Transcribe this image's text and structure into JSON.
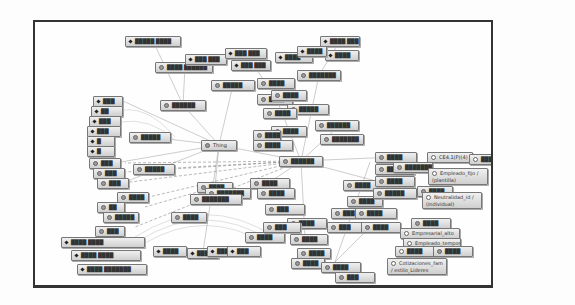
{
  "diagram": {
    "type": "ontology-graph",
    "frame": {
      "border_color": "#333333",
      "background": "#fefefe"
    },
    "colors": {
      "node_fill_top": "#f0f0f0",
      "node_fill_bottom": "#cfcfcf",
      "node_border": "#777777",
      "edge": "#999999"
    },
    "center_nodes": [
      {
        "id": "thing",
        "label": "Thing"
      }
    ],
    "nodes": [
      {
        "id": "n1",
        "label": "█████ ████",
        "kind": "ind",
        "x": 90,
        "y": 14,
        "w": 56
      },
      {
        "id": "n2",
        "label": "████ ██████",
        "kind": "cls",
        "x": 120,
        "y": 40,
        "w": 58
      },
      {
        "id": "n3",
        "label": "███ ███",
        "kind": "ind",
        "x": 150,
        "y": 32,
        "w": 42
      },
      {
        "id": "n4",
        "label": "███ ███",
        "kind": "ind",
        "x": 190,
        "y": 26,
        "w": 42
      },
      {
        "id": "n5",
        "label": "███ ███",
        "kind": "ind",
        "x": 196,
        "y": 38,
        "w": 40
      },
      {
        "id": "n6",
        "label": "████",
        "kind": "ind",
        "x": 240,
        "y": 30,
        "w": 38
      },
      {
        "id": "n7",
        "label": "████ ███",
        "kind": "ind",
        "x": 285,
        "y": 14,
        "w": 40
      },
      {
        "id": "n8",
        "label": "████",
        "kind": "ind",
        "x": 290,
        "y": 28,
        "w": 34
      },
      {
        "id": "n9",
        "label": "████",
        "kind": "ind",
        "x": 262,
        "y": 24,
        "w": 30
      },
      {
        "id": "n10",
        "label": "███████",
        "kind": "cls",
        "x": 262,
        "y": 48,
        "w": 44
      },
      {
        "id": "n11",
        "label": "█████",
        "kind": "cls",
        "x": 176,
        "y": 58,
        "w": 44
      },
      {
        "id": "n12",
        "label": "██████",
        "kind": "cls",
        "x": 125,
        "y": 78,
        "w": 46
      },
      {
        "id": "n13",
        "label": "████",
        "kind": "cls",
        "x": 222,
        "y": 56,
        "w": 38
      },
      {
        "id": "n14",
        "label": "████",
        "kind": "cls",
        "x": 222,
        "y": 72,
        "w": 36
      },
      {
        "id": "n15",
        "label": "████",
        "kind": "cls",
        "x": 236,
        "y": 68,
        "w": 36
      },
      {
        "id": "n16",
        "label": "█████",
        "kind": "cls",
        "x": 252,
        "y": 82,
        "w": 42
      },
      {
        "id": "n17",
        "label": "████",
        "kind": "cls",
        "x": 228,
        "y": 86,
        "w": 34
      },
      {
        "id": "n18",
        "label": "██████",
        "kind": "cls",
        "x": 280,
        "y": 98,
        "w": 44
      },
      {
        "id": "n19",
        "label": "████",
        "kind": "cls",
        "x": 236,
        "y": 104,
        "w": 36
      },
      {
        "id": "n20",
        "label": "████",
        "kind": "cls",
        "x": 218,
        "y": 108,
        "w": 28
      },
      {
        "id": "n21",
        "label": "████",
        "kind": "cls",
        "x": 218,
        "y": 118,
        "w": 40
      },
      {
        "id": "n22",
        "label": "███████",
        "kind": "cls",
        "x": 285,
        "y": 112,
        "w": 44
      },
      {
        "id": "n23",
        "label": "█████",
        "kind": "cls",
        "x": 94,
        "y": 110,
        "w": 42
      },
      {
        "id": "n24",
        "label": "███",
        "kind": "ind",
        "x": 58,
        "y": 74,
        "w": 30
      },
      {
        "id": "n25",
        "label": "██",
        "kind": "ind",
        "x": 56,
        "y": 84,
        "w": 32
      },
      {
        "id": "n26",
        "label": "███",
        "kind": "ind",
        "x": 54,
        "y": 94,
        "w": 32
      },
      {
        "id": "n27",
        "label": "███",
        "kind": "ind",
        "x": 52,
        "y": 104,
        "w": 34
      },
      {
        "id": "n28",
        "label": "█",
        "kind": "ind",
        "x": 52,
        "y": 114,
        "w": 28
      },
      {
        "id": "n29",
        "label": "█",
        "kind": "ind",
        "x": 52,
        "y": 124,
        "w": 28
      },
      {
        "id": "n30",
        "label": "███",
        "kind": "cls",
        "x": 54,
        "y": 136,
        "w": 32
      },
      {
        "id": "n31",
        "label": "███",
        "kind": "cls",
        "x": 58,
        "y": 146,
        "w": 32
      },
      {
        "id": "n32",
        "label": "███",
        "kind": "cls",
        "x": 62,
        "y": 156,
        "w": 32
      },
      {
        "id": "n33",
        "label": "█████",
        "kind": "cls",
        "x": 98,
        "y": 142,
        "w": 42
      },
      {
        "id": "n34",
        "label": "████",
        "kind": "cls",
        "x": 82,
        "y": 170,
        "w": 32
      },
      {
        "id": "n35",
        "label": "██",
        "kind": "cls",
        "x": 62,
        "y": 180,
        "w": 28
      },
      {
        "id": "n36",
        "label": "█████",
        "kind": "cls",
        "x": 68,
        "y": 190,
        "w": 36
      },
      {
        "id": "n37",
        "label": "███",
        "kind": "cls",
        "x": 60,
        "y": 204,
        "w": 30
      },
      {
        "id": "n38",
        "label": "████ ████",
        "kind": "ind",
        "x": 26,
        "y": 215,
        "w": 84
      },
      {
        "id": "n39",
        "label": "████ ████",
        "kind": "ind",
        "x": 36,
        "y": 228,
        "w": 70
      },
      {
        "id": "n40",
        "label": "████ ███████",
        "kind": "ind",
        "x": 42,
        "y": 242,
        "w": 70
      },
      {
        "id": "n41",
        "label": "████",
        "kind": "cls",
        "x": 136,
        "y": 190,
        "w": 36
      },
      {
        "id": "n42",
        "label": "███████",
        "kind": "cls",
        "x": 170,
        "y": 166,
        "w": 46
      },
      {
        "id": "n43",
        "label": "███████",
        "kind": "cls",
        "x": 155,
        "y": 172,
        "w": 52
      },
      {
        "id": "n44",
        "label": "████",
        "kind": "ind",
        "x": 118,
        "y": 224,
        "w": 34
      },
      {
        "id": "n45",
        "label": "████",
        "kind": "ind",
        "x": 152,
        "y": 226,
        "w": 32
      },
      {
        "id": "n46",
        "label": "███",
        "kind": "ind",
        "x": 172,
        "y": 224,
        "w": 30
      },
      {
        "id": "n47",
        "label": "███",
        "kind": "ind",
        "x": 192,
        "y": 224,
        "w": 34
      },
      {
        "id": "n48",
        "label": "████",
        "kind": "cls",
        "x": 210,
        "y": 210,
        "w": 40
      },
      {
        "id": "n49",
        "label": "████",
        "kind": "cls",
        "x": 222,
        "y": 166,
        "w": 38
      },
      {
        "id": "n50",
        "label": "███",
        "kind": "cls",
        "x": 230,
        "y": 182,
        "w": 40
      },
      {
        "id": "n51",
        "label": "████",
        "kind": "cls",
        "x": 252,
        "y": 196,
        "w": 40
      },
      {
        "id": "n52",
        "label": "███",
        "kind": "cls",
        "x": 228,
        "y": 200,
        "w": 38
      },
      {
        "id": "n53",
        "label": "████",
        "kind": "cls",
        "x": 255,
        "y": 212,
        "w": 38
      },
      {
        "id": "n54",
        "label": "████",
        "kind": "cls",
        "x": 262,
        "y": 226,
        "w": 34
      },
      {
        "id": "n55",
        "label": "████",
        "kind": "cls",
        "x": 256,
        "y": 236,
        "w": 34
      },
      {
        "id": "n56",
        "label": "████",
        "kind": "cls",
        "x": 308,
        "y": 158,
        "w": 36
      },
      {
        "id": "n57",
        "label": "████",
        "kind": "cls",
        "x": 312,
        "y": 174,
        "w": 36
      },
      {
        "id": "n58",
        "label": "███",
        "kind": "cls",
        "x": 296,
        "y": 186,
        "w": 40
      },
      {
        "id": "n59",
        "label": "███",
        "kind": "cls",
        "x": 292,
        "y": 200,
        "w": 36
      },
      {
        "id": "n60",
        "label": "████",
        "kind": "cls",
        "x": 340,
        "y": 130,
        "w": 42
      },
      {
        "id": "n61",
        "label": "████",
        "kind": "cls",
        "x": 340,
        "y": 142,
        "w": 40
      },
      {
        "id": "n62",
        "label": "████",
        "kind": "cls",
        "x": 340,
        "y": 154,
        "w": 40
      },
      {
        "id": "n63",
        "label": "█████",
        "kind": "cls",
        "x": 338,
        "y": 166,
        "w": 44
      },
      {
        "id": "n64",
        "label": "████",
        "kind": "cls",
        "x": 320,
        "y": 186,
        "w": 42
      },
      {
        "id": "n65",
        "label": "████",
        "kind": "cls",
        "x": 326,
        "y": 200,
        "w": 40
      },
      {
        "id": "n66",
        "label": "████",
        "kind": "cls",
        "x": 286,
        "y": 240,
        "w": 40
      },
      {
        "id": "n67",
        "label": "███",
        "kind": "cls",
        "x": 300,
        "y": 250,
        "w": 40
      },
      {
        "id": "n68",
        "label": "CE4.1(P)(4)",
        "kind": "hollow",
        "x": 392,
        "y": 130,
        "w": 46
      },
      {
        "id": "n69",
        "label": "████",
        "kind": "hollow",
        "x": 434,
        "y": 132,
        "w": 26
      },
      {
        "id": "n70",
        "label": "████████",
        "kind": "cls",
        "x": 358,
        "y": 140,
        "w": 40
      },
      {
        "id": "n71",
        "label": "Empleado_fijo / (plantilla)",
        "kind": "hollow",
        "x": 393,
        "y": 146,
        "w": 60,
        "tall": true
      },
      {
        "id": "n72",
        "label": "████",
        "kind": "cls",
        "x": 382,
        "y": 164,
        "w": 36
      },
      {
        "id": "n73",
        "label": "Neutralidad_id / (individual)",
        "kind": "hollow",
        "x": 387,
        "y": 170,
        "w": 60,
        "tall": true
      },
      {
        "id": "n74",
        "label": "████",
        "kind": "cls",
        "x": 376,
        "y": 196,
        "w": 40
      },
      {
        "id": "n75",
        "label": "Empresarial_alto",
        "kind": "hollow",
        "x": 365,
        "y": 206,
        "w": 60
      },
      {
        "id": "n76",
        "label": "Empleado_temporal",
        "kind": "hollow",
        "x": 368,
        "y": 216,
        "w": 58
      },
      {
        "id": "n77",
        "label": "████",
        "kind": "hollow",
        "x": 360,
        "y": 224,
        "w": 44
      },
      {
        "id": "n78",
        "label": "████",
        "kind": "cls",
        "x": 398,
        "y": 224,
        "w": 40
      },
      {
        "id": "n79",
        "label": "Cotizaciones_fam / estilo_Lideres",
        "kind": "hollow",
        "x": 352,
        "y": 236,
        "w": 60,
        "tall": true
      }
    ],
    "special_nodes": {
      "thing": {
        "label": "Thing",
        "x": 166,
        "y": 118,
        "w": 36
      },
      "hub": {
        "label": "██████",
        "x": 244,
        "y": 134,
        "w": 44
      },
      "hub2": {
        "label": "████",
        "x": 215,
        "y": 156,
        "w": 40
      },
      "mid1": {
        "label": "████",
        "x": 162,
        "y": 160,
        "w": 36
      }
    }
  }
}
